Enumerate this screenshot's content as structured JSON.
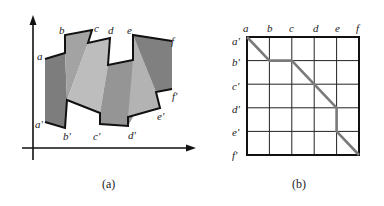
{
  "figure_a": {
    "caption": "(a)",
    "top_labels": [
      "a",
      "b",
      "c",
      "d",
      "e",
      "f"
    ],
    "bottom_labels": [
      "a'",
      "b'",
      "c'",
      "d'",
      "e'",
      "f'"
    ],
    "colors": {
      "dark": "#7d7d7d",
      "medium": "#9c9c9c",
      "light": "#bdbdbd",
      "outline": "#111111"
    }
  },
  "figure_b": {
    "caption": "(b)",
    "column_labels": [
      "a",
      "b",
      "c",
      "d",
      "e",
      "f"
    ],
    "row_labels": [
      "a'",
      "b'",
      "c'",
      "d'",
      "e'",
      "f'"
    ],
    "path": [
      [
        "a",
        "a'"
      ],
      [
        "b",
        "b'"
      ],
      [
        "c",
        "b'"
      ],
      [
        "d",
        "c'"
      ],
      [
        "e",
        "d'"
      ],
      [
        "e",
        "e'"
      ],
      [
        "f",
        "f'"
      ]
    ],
    "colors": {
      "grid": "#222222",
      "path": "#7a7a7a"
    }
  }
}
